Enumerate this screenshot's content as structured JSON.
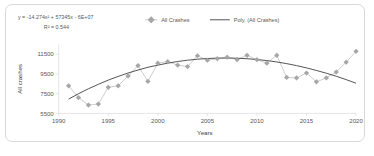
{
  "figure": {
    "equation": "y = -14.274x² + 57345x - 6E+07",
    "r_squared": "R² = 0.544",
    "legend": {
      "series_label": "All Crashes",
      "trend_label": "Poly. (All Crashes)"
    }
  },
  "chart_data": {
    "type": "line",
    "title": "",
    "subtitle": "",
    "xlabel": "Years",
    "ylabel": "All crashes",
    "xlim": [
      1990,
      2020
    ],
    "ylim": [
      5500,
      12500
    ],
    "xticks": [
      1990,
      1995,
      2000,
      2005,
      2010,
      2015,
      2020
    ],
    "xticklabels": [
      "1990",
      "1995",
      "2000",
      "2005",
      "2010",
      "2015",
      "2020"
    ],
    "yticks": [
      5500,
      7500,
      9500,
      11500
    ],
    "yticklabels": [
      "5500",
      "7500",
      "9500",
      "11500"
    ],
    "grid": false,
    "legend_position": "top",
    "marker": "diamond",
    "marker_color": "#a6a6a6",
    "line_color": "#bfbfbf",
    "trend_color": "#404040",
    "annotations": [
      "y = -14.274x² + 57345x - 6E+07",
      "R² = 0.544"
    ],
    "x": [
      1991,
      1992,
      1993,
      1994,
      1995,
      1996,
      1997,
      1998,
      1999,
      2000,
      2001,
      2002,
      2003,
      2004,
      2005,
      2006,
      2007,
      2008,
      2009,
      2010,
      2011,
      2012,
      2013,
      2014,
      2015,
      2016,
      2017,
      2018,
      2019,
      2020
    ],
    "series": [
      {
        "name": "All Crashes",
        "values": [
          8300,
          7100,
          6350,
          6450,
          8150,
          8300,
          9300,
          10350,
          8750,
          10600,
          10750,
          10400,
          10250,
          11350,
          10900,
          11050,
          11200,
          10950,
          11400,
          10950,
          10600,
          11400,
          9150,
          9100,
          9600,
          8700,
          9100,
          9700,
          10700,
          11800
        ]
      },
      {
        "name": "Poly. (All Crashes)",
        "type": "trendline",
        "equation": "y = -14.274x² + 57345x - 6E+07",
        "r_squared": 0.544,
        "values": [
          6950,
          7500,
          8000,
          8450,
          8880,
          9250,
          9600,
          9900,
          10180,
          10400,
          10600,
          10770,
          10900,
          11000,
          11070,
          11110,
          11120,
          11100,
          11050,
          10970,
          10860,
          10720,
          10550,
          10350,
          10120,
          9860,
          9580,
          9270,
          8930,
          8560
        ]
      }
    ]
  }
}
